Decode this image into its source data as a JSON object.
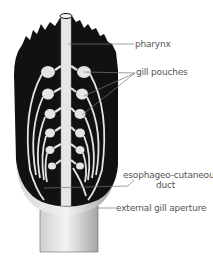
{
  "figure": {
    "labels": {
      "pharynx": "pharynx",
      "gill_pouches": "gill pouches",
      "esophageo_cutaneous_line1": "esophageo-cutaneous",
      "esophageo_cutaneous_line2": "duct",
      "external_gill_aperture": "external gill aperture"
    },
    "colors": {
      "body_dark": "#111111",
      "structure_light": "#e8e8e8",
      "skin_gray": "#bdbdbd",
      "label_text": "#555555",
      "leader_line": "#777777"
    }
  }
}
